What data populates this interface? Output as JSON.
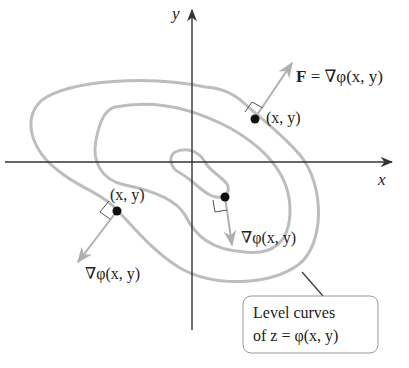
{
  "axes": {
    "x_label": "x",
    "y_label": "y"
  },
  "labels": {
    "field_label_F": "F",
    "field_label_eq": " = ∇φ(x, y)",
    "point_upper_right": "(x, y)",
    "point_lower_left": "(x, y)",
    "gradient_lower_left": "∇φ(x, y)",
    "gradient_center": "∇φ(x, y)",
    "callout_line1": "Level curves",
    "callout_line2": "of z = φ(x, y)"
  },
  "colors": {
    "curve": "#b8b8b8",
    "axis": "#333333",
    "arrow": "#b0b0b0",
    "point": "#111111",
    "callout_border": "#999999"
  }
}
